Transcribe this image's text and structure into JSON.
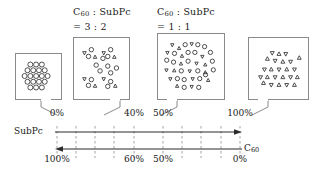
{
  "figure": {
    "type": "blend-ratio-morphology-diagram"
  },
  "callouts": [
    {
      "id": "callout-0",
      "ratio_label": null,
      "composition": {
        "subpc_percent": "0%",
        "c60_percent": "100%"
      },
      "content": "ordered hexagonal packing of circles",
      "species": {
        "circles": 19,
        "triangles_up": 0,
        "triangles_down": 0
      },
      "box": {
        "x": 15,
        "y": 53,
        "w": 47,
        "h": 47
      },
      "tail": {
        "from_x": 46,
        "from_y": 100,
        "to_x": 57,
        "to_y": 114
      }
    },
    {
      "id": "callout-1",
      "ratio_label": {
        "left": "C",
        "left_sub": "60",
        "sep": " : ",
        "right": "SubPc",
        "value": "= 3 : 2"
      },
      "composition": {
        "subpc_percent": "40%",
        "c60_percent": "60%"
      },
      "content": "clustered mix, circle-rich",
      "species": {
        "circles": 14,
        "triangles_up": 6,
        "triangles_down": 6
      },
      "box": {
        "x": 73,
        "y": 37,
        "w": 57,
        "h": 63
      },
      "tail": {
        "from_x": 112,
        "from_y": 100,
        "to_x": 101,
        "to_y": 114
      }
    },
    {
      "id": "callout-2",
      "ratio_label": {
        "left": "C",
        "left_sub": "60",
        "sep": " : ",
        "right": "SubPc",
        "value": "= 1 : 1"
      },
      "composition": {
        "subpc_percent": "50%",
        "c60_percent": "50%"
      },
      "content": "finely intermixed circles and triangles",
      "species": {
        "circles": 22,
        "triangles_up": 13,
        "triangles_down": 12
      },
      "box": {
        "x": 157,
        "y": 33,
        "w": 68,
        "h": 67
      },
      "tail": {
        "from_x": 172,
        "from_y": 100,
        "to_x": 160,
        "to_y": 114
      }
    },
    {
      "id": "callout-3",
      "ratio_label": null,
      "composition": {
        "subpc_percent": "100%",
        "c60_percent": "0%"
      },
      "content": "triangles only",
      "species": {
        "circles": 0,
        "triangles_up": 13,
        "triangles_down": 11
      },
      "box": {
        "x": 248,
        "y": 37,
        "w": 61,
        "h": 63
      },
      "tail": {
        "from_x": 263,
        "from_y": 100,
        "to_x": 251,
        "to_y": 114
      }
    }
  ],
  "axis": {
    "top": {
      "name": "SubPc",
      "name_sub": "",
      "direction": "left-to-right",
      "labels": [
        {
          "text": "0%",
          "x": 57
        },
        {
          "text": "40%",
          "x": 134
        },
        {
          "text": "50%",
          "x": 163
        },
        {
          "text": "100%",
          "x": 240
        }
      ]
    },
    "bottom": {
      "name": "C",
      "name_sub": "60",
      "direction": "right-to-left",
      "labels": [
        {
          "text": "100%",
          "x": 57
        },
        {
          "text": "60%",
          "x": 134
        },
        {
          "text": "50%",
          "x": 163
        },
        {
          "text": "0%",
          "x": 240
        }
      ]
    },
    "gridline_x": [
      57,
      76,
      95,
      114,
      134,
      163,
      182,
      201,
      221,
      240
    ],
    "track": {
      "x_start": 57,
      "x_end": 240,
      "top_y": 24,
      "bottom_y": 41
    }
  },
  "colors": {
    "stroke": "#8a8a8a",
    "particle_stroke": "#2b2b2b",
    "text": "#1a1a1a",
    "grid": "#9a9a9a",
    "background": "#ffffff"
  }
}
